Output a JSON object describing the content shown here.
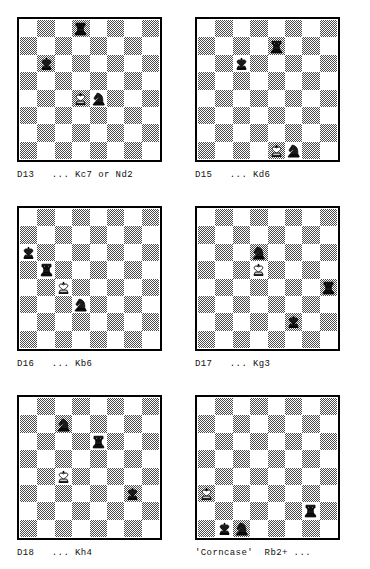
{
  "page": {
    "board_colors": {
      "light": "#ffffff",
      "dark": "#4a4a4a",
      "border": "#000000"
    },
    "columns": 2,
    "rows": 3
  },
  "glyphs": {
    "white_king": "white-king",
    "black_king": "black-king",
    "black_rook": "black-rook",
    "white_rook": "white-rook",
    "black_knight": "black-knight"
  },
  "diagrams": [
    {
      "id": "D13",
      "caption": "D13   ... Kc7 or Nd2",
      "label": "D13",
      "move_text": "... Kc7 or Nd2",
      "pieces": [
        {
          "square": "d8",
          "piece": "black_rook",
          "file": 3,
          "rank": 7
        },
        {
          "square": "b6",
          "piece": "black_king",
          "file": 1,
          "rank": 5
        },
        {
          "square": "d4",
          "piece": "white_king",
          "file": 3,
          "rank": 3
        },
        {
          "square": "e4",
          "piece": "black_knight",
          "file": 4,
          "rank": 3
        }
      ]
    },
    {
      "id": "D15",
      "caption": "D15   ... Kd6",
      "label": "D15",
      "move_text": "... Kd6",
      "pieces": [
        {
          "square": "e7",
          "piece": "black_rook",
          "file": 4,
          "rank": 6
        },
        {
          "square": "c6",
          "piece": "black_king",
          "file": 2,
          "rank": 5
        },
        {
          "square": "e1",
          "piece": "white_king",
          "file": 4,
          "rank": 0
        },
        {
          "square": "f1",
          "piece": "black_knight",
          "file": 5,
          "rank": 0
        }
      ]
    },
    {
      "id": "D16",
      "caption": "D16   ... Kb6",
      "label": "D16",
      "move_text": "... Kb6",
      "pieces": [
        {
          "square": "a6",
          "piece": "black_king",
          "file": 0,
          "rank": 5
        },
        {
          "square": "b5",
          "piece": "black_rook",
          "file": 1,
          "rank": 4
        },
        {
          "square": "c4",
          "piece": "white_king",
          "file": 2,
          "rank": 3
        },
        {
          "square": "d3",
          "piece": "black_knight",
          "file": 3,
          "rank": 2
        }
      ]
    },
    {
      "id": "D17",
      "caption": "D17   ... Kg3",
      "label": "D17",
      "move_text": "... Kg3",
      "pieces": [
        {
          "square": "d6",
          "piece": "black_knight",
          "file": 3,
          "rank": 5
        },
        {
          "square": "d5",
          "piece": "white_king",
          "file": 3,
          "rank": 4
        },
        {
          "square": "h4",
          "piece": "black_rook",
          "file": 7,
          "rank": 3
        },
        {
          "square": "f2",
          "piece": "black_king",
          "file": 5,
          "rank": 1
        }
      ]
    },
    {
      "id": "D18",
      "caption": "D18   ... Kh4",
      "label": "D18",
      "move_text": "... Kh4",
      "pieces": [
        {
          "square": "c7",
          "piece": "black_knight",
          "file": 2,
          "rank": 6
        },
        {
          "square": "e6",
          "piece": "black_rook",
          "file": 4,
          "rank": 5
        },
        {
          "square": "c4",
          "piece": "white_king",
          "file": 2,
          "rank": 3
        },
        {
          "square": "g3",
          "piece": "black_king",
          "file": 6,
          "rank": 2
        }
      ]
    },
    {
      "id": "Corncase",
      "caption": "'Corncase'  Rb2+ ...",
      "label": "'Corncase'",
      "move_text": "Rb2+ ...",
      "pieces": [
        {
          "square": "a3",
          "piece": "white_king",
          "file": 0,
          "rank": 2
        },
        {
          "square": "g2",
          "piece": "black_rook",
          "file": 6,
          "rank": 1
        },
        {
          "square": "b1",
          "piece": "black_king",
          "file": 1,
          "rank": 0
        },
        {
          "square": "c1",
          "piece": "black_knight",
          "file": 2,
          "rank": 0
        }
      ]
    }
  ]
}
